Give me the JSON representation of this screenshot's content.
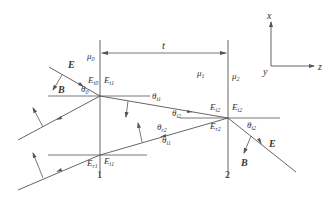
{
  "diagram": {
    "type": "multilayer-reflection-transmission",
    "colors": {
      "line": "#555555",
      "text": "#333333",
      "background": "#ffffff"
    },
    "axes": {
      "x_label": "x",
      "y_label": "y",
      "z_label": "z"
    },
    "dimension": {
      "label": "t"
    },
    "media": {
      "mu0": "μ",
      "mu0_sub": "0",
      "mu1": "μ",
      "mu1_sub": "1",
      "mu2": "μ",
      "mu2_sub": "2"
    },
    "interfaces": {
      "left_label": "1",
      "right_label": "2"
    },
    "incident": {
      "E_label": "E",
      "B_label": "B",
      "angle": "θ",
      "angle_sub": "0"
    },
    "fields": {
      "Ei0": {
        "main": "E",
        "sub": "i0"
      },
      "Et1": {
        "main": "E",
        "sub": "t1"
      },
      "Ei1": {
        "main": "E",
        "sub": "i1"
      },
      "Er1": {
        "main": "E",
        "sub": "r1"
      },
      "Ei2": {
        "main": "E",
        "sub": "i2"
      },
      "Et2": {
        "main": "E",
        "sub": "t2"
      },
      "Er2": {
        "main": "E",
        "sub": "r2"
      }
    },
    "angles": {
      "t1": {
        "main": "θ",
        "sub": "t1"
      },
      "i2": {
        "main": "θ",
        "sub": "i2"
      },
      "r2": {
        "main": "θ",
        "sub": "r2"
      },
      "i1": {
        "main": "θ",
        "sub": "i1"
      },
      "t2": {
        "main": "θ",
        "sub": "t2"
      }
    },
    "output": {
      "E_label": "E",
      "B_label": "B"
    }
  }
}
